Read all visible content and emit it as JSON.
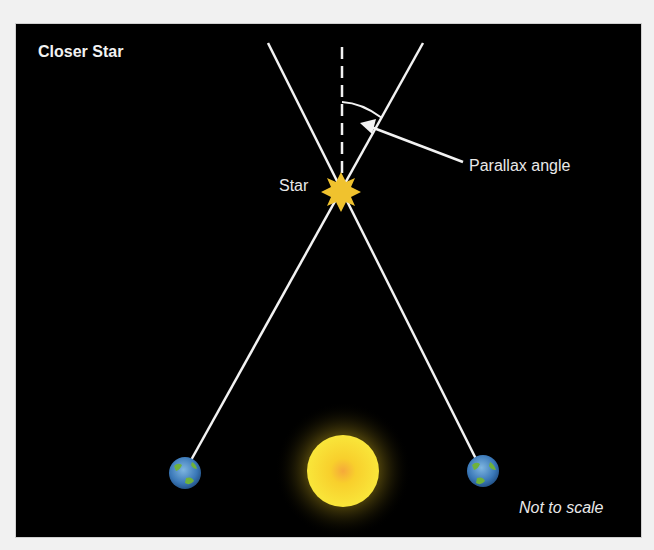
{
  "diagram": {
    "title": "Closer Star",
    "labels": {
      "star": "Star",
      "parallax_angle": "Parallax angle",
      "scale_note": "Not to scale"
    },
    "elements": {
      "star": {
        "x": 341,
        "y": 192,
        "color": "#f0c22e"
      },
      "sun": {
        "x": 343,
        "y": 470,
        "color": "#f7d92a",
        "glow": "#b59a12"
      },
      "earth_left": {
        "x": 185,
        "y": 472
      },
      "earth_right": {
        "x": 483,
        "y": 471
      }
    },
    "colors": {
      "background": "#000000",
      "page": "#f1f1f1",
      "lines": "#f2f2f2",
      "star": "#f0c22e",
      "sun": "#f7d92a"
    }
  }
}
